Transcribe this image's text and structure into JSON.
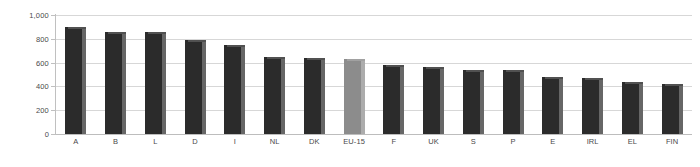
{
  "chart_data": {
    "type": "bar",
    "title": "",
    "subtitle": "",
    "xlabel": "",
    "ylabel": "",
    "ylim": [
      0,
      1000
    ],
    "yticks": [
      0,
      200,
      400,
      600,
      800,
      1000
    ],
    "ytick_labels": [
      "0",
      "200",
      "400",
      "600",
      "800",
      "1,000"
    ],
    "grid": true,
    "legend": false,
    "legend_position": "none",
    "categories": [
      "A",
      "B",
      "L",
      "D",
      "I",
      "NL",
      "DK",
      "EU-15",
      "F",
      "UK",
      "S",
      "P",
      "E",
      "IRL",
      "EL",
      "FIN"
    ],
    "values": [
      900,
      860,
      860,
      790,
      750,
      650,
      640,
      630,
      580,
      560,
      540,
      535,
      475,
      470,
      440,
      420
    ],
    "bar_colors": [
      "#2b2b2b",
      "#2b2b2b",
      "#2b2b2b",
      "#2b2b2b",
      "#2b2b2b",
      "#2b2b2b",
      "#2b2b2b",
      "#8c8c8c",
      "#2b2b2b",
      "#2b2b2b",
      "#2b2b2b",
      "#2b2b2b",
      "#2b2b2b",
      "#2b2b2b",
      "#2b2b2b",
      "#2b2b2b"
    ],
    "highlight_category": "EU-15",
    "highlight_color": "#8c8c8c",
    "series_color": "#2b2b2b",
    "gridline_color": "#d7d7d7",
    "axis_color": "#bdbdbd",
    "tick_label_color": "#4a4a4a",
    "background_color": "#ffffff"
  }
}
